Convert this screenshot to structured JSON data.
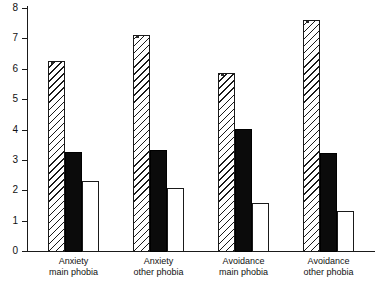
{
  "chart_data": {
    "type": "bar",
    "title": "",
    "subtitle": "",
    "xlabel": "",
    "ylabel": "",
    "ylim": [
      0,
      8
    ],
    "yticks": [
      "0",
      "1",
      "2",
      "3",
      "4",
      "5",
      "6",
      "7",
      "8"
    ],
    "grid": false,
    "legend_position": "none",
    "categories": [
      "Anxiety main phobia",
      "Anxiety other phobia",
      "Avoidance main phobia",
      "Avoidance other phobia"
    ],
    "category_lines": [
      {
        "line1": "Anxiety",
        "line2": "main phobia"
      },
      {
        "line1": "Anxiety",
        "line2": "other phobia"
      },
      {
        "line1": "Avoidance",
        "line2": "main phobia"
      },
      {
        "line1": "Avoidance",
        "line2": "other phobia"
      }
    ],
    "series": [
      {
        "name": "hatched",
        "fill": "diagonal-hatch",
        "values": [
          6.3,
          7.15,
          5.9,
          7.65
        ]
      },
      {
        "name": "black",
        "fill": "solid-black",
        "values": [
          3.3,
          3.35,
          4.05,
          3.25
        ]
      },
      {
        "name": "white",
        "fill": "white-outline",
        "values": [
          2.35,
          2.1,
          1.6,
          1.35
        ]
      }
    ],
    "colors": {
      "axis": "#1a1a1a",
      "hatch": "#1a1a1a",
      "black_bar": "#0b0b0b",
      "white_bar": "#ffffff",
      "background": "#ffffff"
    }
  }
}
